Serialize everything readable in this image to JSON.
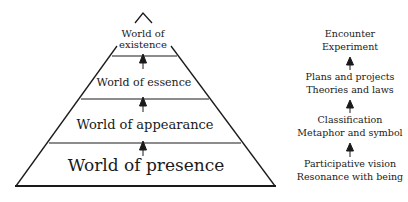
{
  "pyramid": {
    "levels": [
      {
        "label_line1": "World of",
        "label_line2": "existence"
      },
      {
        "label": "World of essence"
      },
      {
        "label": "World of appearance"
      },
      {
        "label": "World of presence"
      }
    ]
  },
  "ladder": {
    "groups": [
      {
        "line1": "Encounter",
        "line2": "Experiment"
      },
      {
        "line1": "Plans and projects",
        "line2": "Theories and laws"
      },
      {
        "line1": "Classification",
        "line2": "Metaphor and symbol"
      },
      {
        "line1": "Participative vision",
        "line2": "Resonance with being"
      }
    ]
  },
  "colors": {
    "stroke": "#1a1a1a",
    "background": "#ffffff"
  }
}
